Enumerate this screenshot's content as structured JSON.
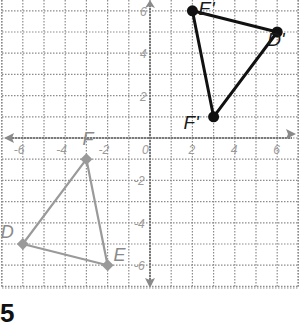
{
  "figure": {
    "type": "coordinate-plane-transformation",
    "grid": {
      "x_range": [
        -7,
        7
      ],
      "y_range": [
        -7,
        6
      ],
      "label_step": 2,
      "grid_on": true,
      "line_style": "dotted"
    },
    "axis_ticks": {
      "x": [
        "-6",
        "-4",
        "-2",
        "0",
        "2",
        "4",
        "6"
      ],
      "y": [
        "6",
        "4",
        "2",
        "-2",
        "-4",
        "-6"
      ]
    },
    "axis_end_labels": {
      "x": "x",
      "y": "y"
    },
    "preimage": {
      "name": "DEF",
      "color": "#9a9a9a",
      "vertices": [
        {
          "label": "D",
          "x": -6,
          "y": -5
        },
        {
          "label": "E",
          "x": -2,
          "y": -6
        },
        {
          "label": "F",
          "x": -3,
          "y": -1
        }
      ]
    },
    "image": {
      "name": "D'E'F'",
      "color": "#111111",
      "vertices": [
        {
          "label": "D'",
          "x": 6,
          "y": 5
        },
        {
          "label": "E'",
          "x": 2,
          "y": 6
        },
        {
          "label": "F'",
          "x": 3,
          "y": 1
        }
      ]
    }
  },
  "problem_number": "5"
}
